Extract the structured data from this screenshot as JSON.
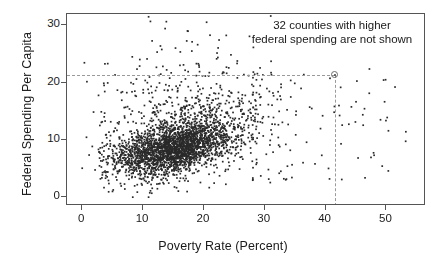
{
  "chart_data": {
    "type": "scatter",
    "title": "",
    "xlabel": "Poverty Rate (Percent)",
    "ylabel": "Federal Spending Per Capita",
    "xlim": [
      -2.5,
      56.5
    ],
    "ylim": [
      -1.5,
      32.0
    ],
    "xticks": [
      0,
      10,
      20,
      30,
      40,
      50
    ],
    "xtick_labels": [
      "0",
      "10",
      "20",
      "30",
      "40",
      "50"
    ],
    "yticks": [
      0,
      10,
      20,
      30
    ],
    "ytick_labels": [
      "0",
      "10",
      "20",
      "30"
    ],
    "grid": false,
    "legend": null,
    "annotations": [
      {
        "name": "truncation-note",
        "line1": "32 counties with higher",
        "line2": "federal spending are not shown",
        "x": 41.0,
        "y": 30.0
      }
    ],
    "highlight_point": {
      "x": 41.5,
      "y": 21.4,
      "marker": "open-circle",
      "guide_lines": "dashed-gray"
    },
    "marker": {
      "style": "dot",
      "size_px": 1.6,
      "color": "#2a2a2a"
    },
    "n_points_plotted": 3100,
    "cluster_model": {
      "core": {
        "n": 1750,
        "x_mean": 15.0,
        "x_sd": 4.6,
        "y_intercept": 5.3,
        "y_slope": 0.21,
        "y_sd": 1.85
      },
      "mid": {
        "n": 780,
        "x_mean": 16.5,
        "x_sd": 6.4,
        "y_intercept": 5.6,
        "y_slope": 0.27,
        "y_sd": 3.3
      },
      "upper": {
        "n": 420,
        "x_mean": 16.0,
        "x_sd": 6.6,
        "y_intercept": 9.0,
        "y_slope": 0.35,
        "y_sd": 6.2
      },
      "sparse_right": {
        "n": 110,
        "x_min": 28.0,
        "x_max": 54.0,
        "y_min": 3.0,
        "y_max": 22.5
      },
      "far_left": {
        "n": 8,
        "x_min": -0.4,
        "x_max": 2.2,
        "y_min": 4.5,
        "y_max": 23.8
      }
    }
  },
  "axis": {
    "x_title": "Poverty Rate (Percent)",
    "y_title": "Federal Spending Per Capita"
  },
  "colors": {
    "background": "#ffffff",
    "frame": "#555555",
    "point": "#2a2a2a",
    "guide": "#9a9a9a",
    "text": "#1a1a1a"
  }
}
